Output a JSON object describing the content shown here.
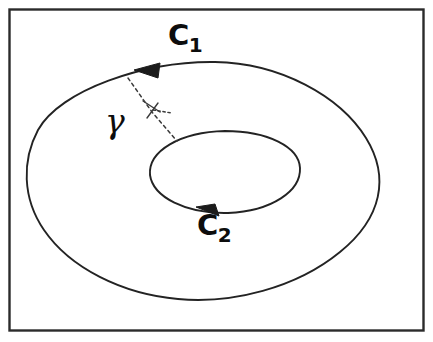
{
  "figure": {
    "background_color": "#ffffff",
    "stroke_color": "#1a1a1a",
    "frame": {
      "name": "figure-border",
      "x": 8,
      "y": 8,
      "width": 416,
      "height": 323,
      "stroke_width": 2.5
    },
    "labels": {
      "c1": {
        "letter": "C",
        "subscript": "1",
        "x": 168,
        "y": 21
      },
      "c2": {
        "letter": "C",
        "subscript": "2",
        "x": 197,
        "y": 211
      },
      "gamma": {
        "symbol": "γ",
        "x": 105,
        "y": 105
      }
    },
    "curves": {
      "outer": {
        "name": "outer-contour-c1",
        "orientation": "counterclockwise",
        "bounds": {
          "left": 28,
          "right": 379,
          "top": 62,
          "bottom": 301
        },
        "arrow_at": {
          "x": 147,
          "y": 70
        },
        "arrow_direction": "left"
      },
      "inner": {
        "name": "inner-contour-c2",
        "orientation": "clockwise",
        "bounds": {
          "left": 150,
          "right": 300,
          "top": 131,
          "bottom": 213
        },
        "arrow_at": {
          "x": 204,
          "y": 211
        },
        "arrow_direction": "right"
      },
      "cut": {
        "name": "gamma-cut-path",
        "style": "dashed",
        "start": {
          "x": 128,
          "y": 78
        },
        "end": {
          "x": 177,
          "y": 141
        },
        "tick_marks": 2
      }
    }
  }
}
